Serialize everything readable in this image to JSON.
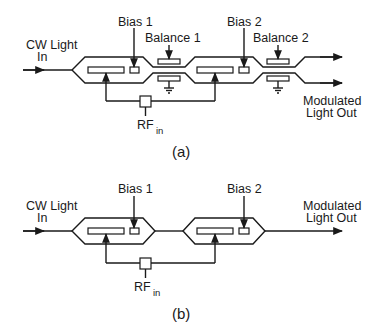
{
  "figure_a": {
    "caption": "(a)",
    "input_label_line1": "CW Light",
    "input_label_line2": "In",
    "bias1_label": "Bias 1",
    "bias2_label": "Bias 2",
    "balance1_label": "Balance 1",
    "balance2_label": "Balance 2",
    "output_label_line1": "Modulated",
    "output_label_line2": "Light Out",
    "rf_label": "RF",
    "rf_subscript": "in"
  },
  "figure_b": {
    "caption": "(b)",
    "input_label_line1": "CW Light",
    "input_label_line2": "In",
    "bias1_label": "Bias 1",
    "bias2_label": "Bias 2",
    "output_label_line1": "Modulated",
    "output_label_line2": "Light Out",
    "rf_label": "RF",
    "rf_subscript": "in"
  },
  "colors": {
    "line": "#1a1a1a",
    "background": "#ffffff"
  }
}
